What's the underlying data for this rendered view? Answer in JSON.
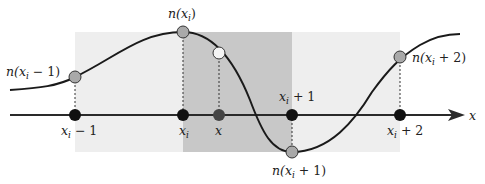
{
  "diagram": {
    "type": "interpolation-grid-diagram",
    "colors": {
      "light_region": "#eeeeee",
      "dark_region": "#c8c8c8",
      "curve": "#1a1a1a",
      "axis": "#2a2a2a",
      "grid_point": "#111111",
      "sample_point": "#a9a9a9",
      "query_point": "#f4f4f4",
      "query_axis_point": "#444444"
    },
    "axis": {
      "label": "x"
    },
    "grid_points": [
      {
        "id": "xi-minus-1",
        "label_var": "x",
        "label_sub": "i",
        "label_rest": " − 1"
      },
      {
        "id": "xi",
        "label_var": "x",
        "label_sub": "i",
        "label_rest": ""
      },
      {
        "id": "x",
        "label_var": "x",
        "label_sub": "",
        "label_rest": ""
      },
      {
        "id": "xi-plus-1",
        "label_var": "x",
        "label_sub": "i",
        "label_rest": " + 1"
      },
      {
        "id": "xi-plus-2",
        "label_var": "x",
        "label_sub": "i",
        "label_rest": " + 2"
      }
    ],
    "sample_labels": [
      {
        "id": "n-xi-minus-1",
        "fn": "n(",
        "var": "x",
        "sub": "i",
        "rest": " − 1)"
      },
      {
        "id": "n-xi",
        "fn": "n(",
        "var": "x",
        "sub": "i",
        "rest": ")"
      },
      {
        "id": "n-xi-plus-1",
        "fn": "n(",
        "var": "x",
        "sub": "i",
        "rest": " + 1)"
      },
      {
        "id": "n-xi-plus-2",
        "fn": "n(",
        "var": "x",
        "sub": "i",
        "rest": " + 2)"
      }
    ]
  }
}
